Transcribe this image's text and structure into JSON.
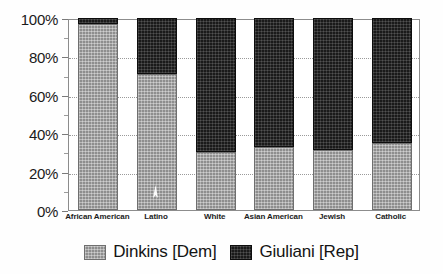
{
  "chart_data": {
    "type": "bar",
    "subtype": "100% stacked vertical bar",
    "title": "",
    "xlabel": "",
    "ylabel": "",
    "ylim": [
      0,
      100
    ],
    "yticks": [
      0,
      20,
      40,
      60,
      80,
      100
    ],
    "ytick_labels": [
      "0%",
      "20%",
      "40%",
      "60%",
      "80%",
      "100%"
    ],
    "grid": true,
    "grid_style": "dotted horizontal",
    "legend_position": "bottom-center",
    "categories": [
      "African American",
      "Latino",
      "White",
      "Asian American",
      "Jewish",
      "Catholic"
    ],
    "series": [
      {
        "name": "Dinkins [Dem]",
        "color": "#8e8e8e",
        "values": [
          97,
          71,
          30,
          33,
          31,
          35
        ]
      },
      {
        "name": "Giuliani [Rep]",
        "color": "#1a1a1a",
        "values": [
          3,
          29,
          70,
          67,
          69,
          65
        ]
      }
    ]
  },
  "axis": {
    "ticks": [
      {
        "label": "100%",
        "value": 100
      },
      {
        "label": "80%",
        "value": 80
      },
      {
        "label": "60%",
        "value": 60
      },
      {
        "label": "40%",
        "value": 40
      },
      {
        "label": "20%",
        "value": 20
      },
      {
        "label": "0%",
        "value": 0
      }
    ]
  },
  "legend": {
    "items": [
      {
        "label": "Dinkins [Dem]",
        "swatch": "dem",
        "color": "#8e8e8e"
      },
      {
        "label": "Giuliani [Rep]",
        "swatch": "rep",
        "color": "#1a1a1a"
      }
    ]
  },
  "artifacts": {
    "cursor": {
      "name": "mouse-cursor-artifact",
      "in_bar": "Latino"
    }
  }
}
